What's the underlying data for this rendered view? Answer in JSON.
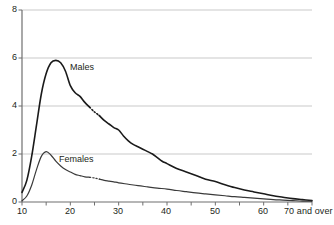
{
  "chart_data": {
    "type": "line",
    "title": "",
    "subtitle": "",
    "xlabel": "",
    "ylabel": "",
    "xlim": [
      10,
      70
    ],
    "ylim": [
      0,
      8
    ],
    "grid": true,
    "grid_axis": "y",
    "legend_position": "inline-annotation",
    "x_tick_labels": [
      "10",
      "20",
      "30",
      "40",
      "50",
      "60",
      "70 and over"
    ],
    "x_tick_values": [
      10,
      20,
      30,
      40,
      50,
      60,
      70
    ],
    "x_minor_tick_values": [
      15,
      25,
      35,
      45,
      55,
      65
    ],
    "y_tick_labels": [
      "0",
      "2",
      "4",
      "6",
      "8"
    ],
    "y_tick_values": [
      0,
      2,
      4,
      6,
      8
    ],
    "series": [
      {
        "name": "Males",
        "color": "#1a1a1a",
        "x": [
          10,
          11,
          12,
          13,
          14,
          15,
          16,
          17,
          18,
          19,
          20,
          21,
          22,
          23,
          24,
          25,
          26,
          27,
          28,
          29,
          30,
          31,
          32,
          33,
          34,
          35,
          36,
          37,
          38,
          39,
          40,
          42,
          44,
          46,
          48,
          50,
          52,
          54,
          56,
          58,
          60,
          62,
          64,
          66,
          68,
          70
        ],
        "y": [
          0.4,
          0.9,
          1.9,
          3.2,
          4.5,
          5.35,
          5.8,
          5.9,
          5.8,
          5.45,
          4.85,
          4.55,
          4.4,
          4.15,
          3.95,
          3.75,
          3.6,
          3.4,
          3.25,
          3.1,
          3.0,
          2.75,
          2.55,
          2.4,
          2.3,
          2.2,
          2.1,
          2.0,
          1.85,
          1.7,
          1.6,
          1.4,
          1.25,
          1.1,
          0.95,
          0.85,
          0.72,
          0.6,
          0.5,
          0.42,
          0.34,
          0.26,
          0.2,
          0.14,
          0.1,
          0.06
        ],
        "gap_segment": [
          24,
          26
        ],
        "annotation": "Males"
      },
      {
        "name": "Females",
        "color": "#3a3a3a",
        "x": [
          10,
          11,
          12,
          13,
          14,
          15,
          16,
          17,
          18,
          19,
          20,
          21,
          22,
          23,
          24,
          25,
          26,
          27,
          28,
          29,
          30,
          32,
          34,
          36,
          38,
          40,
          42,
          44,
          46,
          48,
          50,
          52,
          54,
          56,
          58,
          60,
          62,
          64,
          66,
          68,
          70
        ],
        "y": [
          0.05,
          0.25,
          0.7,
          1.35,
          1.9,
          2.1,
          1.95,
          1.7,
          1.5,
          1.35,
          1.25,
          1.15,
          1.1,
          1.05,
          1.03,
          1.0,
          0.95,
          0.9,
          0.87,
          0.84,
          0.8,
          0.74,
          0.68,
          0.63,
          0.58,
          0.54,
          0.48,
          0.43,
          0.38,
          0.34,
          0.3,
          0.26,
          0.22,
          0.19,
          0.16,
          0.13,
          0.1,
          0.08,
          0.06,
          0.04,
          0.03
        ],
        "gap_segment": [
          24,
          26
        ],
        "annotation": "Females"
      }
    ],
    "annotations": [
      {
        "text": "Males",
        "x": 17.5,
        "y": 5.05
      },
      {
        "text": "Females",
        "x": 15.5,
        "y": 1.8
      }
    ],
    "colors": {
      "gridline": "#c9c9c9",
      "axis": "#6f6f6f",
      "text": "#231f20",
      "background": "#ffffff",
      "males_line": "#1a1a1a",
      "females_line": "#3a3a3a"
    }
  }
}
